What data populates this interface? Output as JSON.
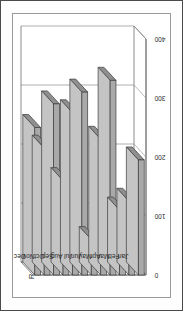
{
  "chart_data": {
    "type": "bar",
    "orientation": "horizontal",
    "style": "3d",
    "title": "",
    "xlabel": "Revenue",
    "ylabel": "",
    "categories": [
      "Jan",
      "Feb",
      "Mar",
      "Apr",
      "May",
      "Jun",
      "Jul",
      "Aug",
      "Sep",
      "Oct",
      "Nov",
      "Dec"
    ],
    "values": [
      195,
      125,
      110,
      330,
      230,
      60,
      310,
      275,
      160,
      290,
      215,
      250
    ],
    "series": [
      {
        "name": "Revenue",
        "values": [
          195,
          125,
          110,
          330,
          230,
          60,
          310,
          275,
          160,
          290,
          215,
          250
        ]
      }
    ],
    "value_axis_label": "Revenue",
    "value_ticks": [
      0,
      100,
      200,
      300,
      400
    ],
    "value_tick_labels": [
      "0",
      "100",
      "200",
      "300",
      "400"
    ],
    "xlim": [
      0,
      400
    ],
    "grid": true,
    "gridlines_at": [
      100,
      200,
      300,
      400
    ],
    "legend": false,
    "legend_position": "none",
    "rotation_deg": -90,
    "bar_fill": "#a9a9a9",
    "bar_top_fill": "#c4c4c4",
    "bar_side_fill": "#8f8f8f",
    "bar_outline": "#3c3c3c",
    "axis_color": "#6f6f6f",
    "grid_color": "#8c8c8c",
    "plot_background": "#ffffff",
    "page_background": "#fdfdfd",
    "frame_color": "#4a4a4a"
  },
  "figure": {
    "axis_title": "Revenue",
    "tick_0": "0",
    "tick_100": "100",
    "tick_200": "200",
    "tick_300": "300",
    "tick_400": "400",
    "cat_0": "Jan",
    "cat_1": "Feb",
    "cat_2": "Mar",
    "cat_3": "Apr",
    "cat_4": "May",
    "cat_5": "Jun",
    "cat_6": "Jul",
    "cat_7": "Aug",
    "cat_8": "Sep",
    "cat_9": "Oct",
    "cat_10": "Nov",
    "cat_11": "Dec"
  }
}
